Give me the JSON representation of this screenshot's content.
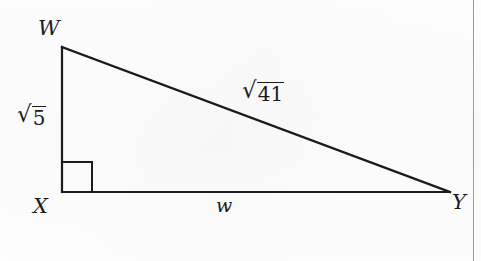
{
  "figure": {
    "type": "geometry-diagram",
    "shape": "right-triangle",
    "background_color": "#fefefe",
    "stroke_color": "#1b1b1b",
    "page_edge_color": "#9a9a9a",
    "vertices": [
      {
        "name": "W",
        "label": "W",
        "x": 62,
        "y": 47
      },
      {
        "name": "X",
        "label": "X",
        "x": 62,
        "y": 192
      },
      {
        "name": "Y",
        "label": "Y",
        "x": 450,
        "y": 192
      }
    ],
    "right_angle": {
      "at_vertex": "X",
      "marker": "square",
      "size": 30
    },
    "sides": [
      {
        "name": "leg-WX",
        "from": "W",
        "to": "X",
        "label_kind": "radical",
        "radical_sign": "√",
        "radicand": "5",
        "label_text": "√5"
      },
      {
        "name": "hypotenuse-WY",
        "from": "W",
        "to": "Y",
        "label_kind": "radical",
        "radical_sign": "√",
        "radicand": "41",
        "label_text": "√41"
      },
      {
        "name": "base-XY",
        "from": "X",
        "to": "Y",
        "label_kind": "variable",
        "label_text": "w"
      }
    ]
  }
}
